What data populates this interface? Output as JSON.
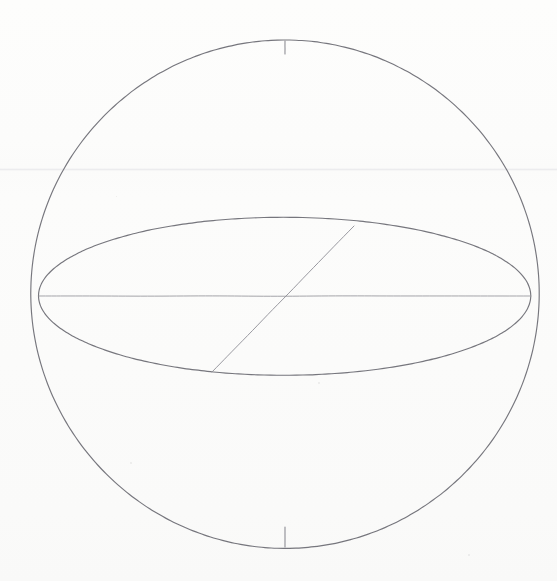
{
  "document": {
    "title": "Sphere with equatorial ellipse",
    "medium": "pencil line drawing on white paper",
    "background_color": "#fcfcfb",
    "ink_color": "#6a6a72",
    "ink_color_light": "#8e8e96",
    "canvas_width": 557,
    "canvas_height": 581
  },
  "figure": {
    "label": "sphere-equator-diagram",
    "elements": [
      {
        "name": "outer-circle",
        "kind": "circle",
        "center_x": 285,
        "center_y": 294,
        "radius": 254,
        "stroke": "#6a6a72",
        "stroke_width": 1.15
      },
      {
        "name": "equator-ellipse",
        "kind": "ellipse",
        "center_x": 285,
        "center_y": 296,
        "radius_x": 246,
        "radius_y": 79,
        "stroke": "#6a6a72",
        "stroke_width": 1.15
      },
      {
        "name": "horizontal-diameter",
        "kind": "line",
        "x1": 39,
        "y1": 296,
        "x2": 531,
        "y2": 296,
        "stroke": "#9a9aa0",
        "stroke_width": 1.0
      },
      {
        "name": "diagonal-chord",
        "kind": "line",
        "x1": 212,
        "y1": 372,
        "x2": 354,
        "y2": 226,
        "stroke": "#8e8e96",
        "stroke_width": 1.0
      },
      {
        "name": "north-pole-tick",
        "kind": "line",
        "x1": 285,
        "y1": 41,
        "x2": 285,
        "y2": 54,
        "stroke": "#82828a",
        "stroke_width": 1.1
      },
      {
        "name": "south-pole-tick",
        "kind": "line",
        "x1": 285,
        "y1": 527,
        "x2": 285,
        "y2": 547,
        "stroke": "#82828a",
        "stroke_width": 1.1
      }
    ],
    "artifacts": [
      {
        "name": "scanner-seam",
        "kind": "horizontal-band",
        "y": 169,
        "opacity": 0.75
      },
      {
        "name": "paper-speck",
        "x": 130,
        "y": 462,
        "size": 2
      },
      {
        "name": "paper-speck",
        "x": 318,
        "y": 382,
        "size": 2
      },
      {
        "name": "paper-speck",
        "x": 468,
        "y": 554,
        "size": 2
      },
      {
        "name": "paper-speck",
        "x": 116,
        "y": 196,
        "size": 1
      }
    ]
  }
}
